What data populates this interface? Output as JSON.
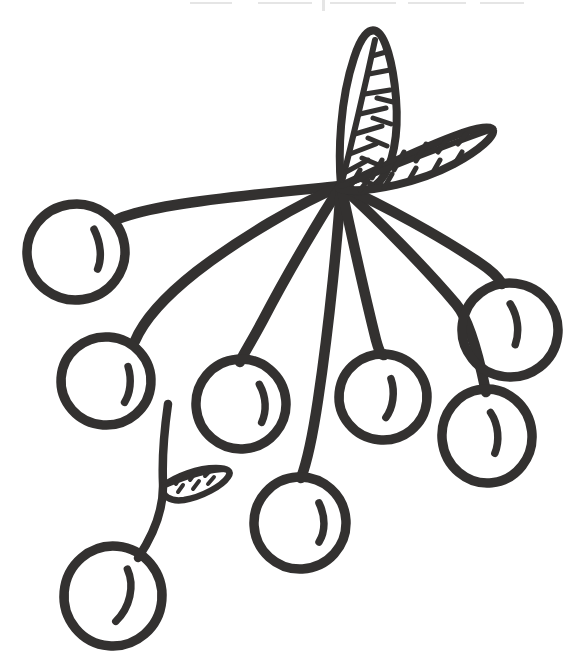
{
  "artwork": {
    "title": "Cherry Cluster Line Drawing",
    "alt_text": "Hand-drawn black outline drawing of a cluster of eight cherries hanging from stems that radiate from a single central point, with three veined leaves",
    "style": "hand-drawn coloring-book line art",
    "background_color": "#ffffff",
    "ink_color": "#333130",
    "canvas": {
      "width": 573,
      "height": 671
    },
    "stem_junction": {
      "x": 341,
      "y": 186
    }
  },
  "cherries": [
    {
      "name": "cherry-upper-left",
      "cx": 76,
      "cy": 252,
      "rx": 49,
      "ry": 48,
      "rotate": -8,
      "gloss": "M 97 232 C 102 247 101 262 95 272"
    },
    {
      "name": "cherry-mid-left",
      "cx": 106,
      "cy": 381,
      "rx": 45,
      "ry": 44,
      "rotate": 4,
      "gloss": "M 127 365 C 132 378 131 392 126 401"
    },
    {
      "name": "cherry-center-left",
      "cx": 241,
      "cy": 404,
      "rx": 45,
      "ry": 45,
      "rotate": -5,
      "gloss": "M 261 386 C 267 399 266 414 260 424"
    },
    {
      "name": "cherry-center",
      "cx": 383,
      "cy": 397,
      "rx": 44,
      "ry": 43,
      "rotate": 6,
      "gloss": "M 389 378 C 395 391 394 407 388 417"
    },
    {
      "name": "cherry-lower-mid",
      "cx": 300,
      "cy": 523,
      "rx": 46,
      "ry": 46,
      "rotate": -3,
      "gloss": "M 320 504 C 326 518 325 533 318 543"
    },
    {
      "name": "cherry-right-upper",
      "cx": 510,
      "cy": 330,
      "rx": 48,
      "ry": 47,
      "rotate": 7,
      "gloss": "M 507 304 C 516 315 520 330 517 344"
    },
    {
      "name": "cherry-right-lower",
      "cx": 487,
      "cy": 436,
      "rx": 45,
      "ry": 47,
      "rotate": -6,
      "gloss": "M 493 413 C 500 426 499 443 493 454"
    },
    {
      "name": "cherry-bottom-left",
      "cx": 113,
      "cy": 596,
      "rx": 49,
      "ry": 50,
      "rotate": 5,
      "gloss": "M 125 568 C 134 584 131 606 118 621"
    }
  ],
  "stems": [
    {
      "name": "stem-to-upper-left",
      "path": "M 341 186 C 300 190 230 196 175 205 C 145 210 128 215 118 219"
    },
    {
      "name": "stem-to-mid-left",
      "path": "M 341 186 C 300 203 240 238 196 272 C 163 298 143 322 135 341"
    },
    {
      "name": "stem-to-center-left",
      "path": "M 341 186 C 322 215 288 272 263 320 C 248 348 241 358 240 362"
    },
    {
      "name": "stem-to-lower-mid",
      "path": "M 341 186 C 338 232 330 320 318 400 C 311 447 304 470 301 478"
    },
    {
      "name": "stem-to-center",
      "path": "M 341 186 C 350 228 366 300 376 340 C 382 362 384 352 384 355"
    },
    {
      "name": "stem-to-right-lower",
      "path": "M 341 186 C 376 218 424 266 456 304 C 473 324 483 378 486 392"
    },
    {
      "name": "stem-to-right-upper",
      "path": "M 341 186 C 383 205 440 236 480 263 C 498 275 500 281 502 284"
    },
    {
      "name": "stem-branch-lower-left",
      "path": "M 168 404 C 164 432 162 460 163 483 C 164 512 150 540 138 558"
    }
  ],
  "leaves": [
    {
      "name": "leaf-upright",
      "outline": "M 341 186 C 338 152 340 100 354 58 C 361 36 369 28 376 31 C 385 35 393 62 396 98 C 399 135 393 166 380 181 C 368 194 352 194 341 186 Z",
      "midrib": "M 341 186 C 350 150 362 100 375 40",
      "veins": [
        "M 346 172 L 368 160",
        "M 350 154 L 376 144",
        "M 355 134 L 382 126",
        "M 360 114 L 386 108",
        "M 365 94 L 390 90",
        "M 369 74 L 390 70",
        "M 372 56 L 386 52",
        "M 357 178 L 372 184",
        "M 362 158 L 381 166",
        "M 368 138 L 387 146",
        "M 373 118 L 391 124",
        "M 377 98 L 393 102"
      ]
    },
    {
      "name": "leaf-right",
      "outline": "M 341 186 C 368 174 416 150 454 136 C 480 126 492 126 493 130 C 495 136 480 150 454 164 C 418 183 372 192 346 190 C 338 189 337 188 341 186 Z",
      "midrib": "M 341 186 C 380 172 438 148 490 130",
      "veins": [
        "M 352 184 L 360 170",
        "M 372 178 L 382 160",
        "M 394 170 L 404 152",
        "M 416 161 L 426 144",
        "M 438 152 L 448 138",
        "M 458 144 L 466 134",
        "M 360 190 L 368 180",
        "M 384 188 L 392 174",
        "M 408 182 L 416 168",
        "M 432 174 L 440 160",
        "M 454 165 L 462 152"
      ]
    },
    {
      "name": "leaf-small-lower",
      "outline": "M 163 486 C 176 476 198 468 216 468 C 228 468 232 471 228 477 C 222 486 202 497 184 500 C 170 502 161 496 163 486 Z",
      "midrib": "M 163 487 C 184 478 210 470 228 470",
      "veins": [
        "M 176 484 L 181 476",
        "M 190 480 L 196 472",
        "M 205 476 L 211 470",
        "M 178 492 L 183 485",
        "M 193 489 L 199 481",
        "M 208 484 L 214 477"
      ]
    }
  ],
  "scan_artifacts": [
    {
      "name": "scan-speck-a",
      "x": 190,
      "y": 2,
      "w": 42,
      "h": 2
    },
    {
      "name": "scan-speck-b",
      "x": 258,
      "y": 2,
      "w": 54,
      "h": 2
    },
    {
      "name": "scan-speck-c",
      "x": 330,
      "y": 2,
      "w": 66,
      "h": 2
    },
    {
      "name": "scan-speck-d",
      "x": 408,
      "y": 2,
      "w": 58,
      "h": 2
    },
    {
      "name": "scan-speck-e",
      "x": 480,
      "y": 2,
      "w": 44,
      "h": 2
    },
    {
      "name": "scan-tick",
      "x": 322,
      "y": 0,
      "w": 3,
      "h": 11
    }
  ]
}
